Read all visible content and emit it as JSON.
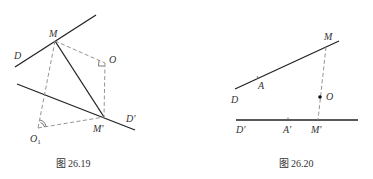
{
  "figures": [
    {
      "caption": "图 26.19",
      "labels": {
        "M": "M",
        "O": "O",
        "D": "D",
        "D_prime": "D'",
        "M_prime": "M'",
        "O1": "O",
        "O1_sub": "1"
      }
    },
    {
      "caption": "图 26.20",
      "labels": {
        "M": "M",
        "A": "A",
        "D": "D",
        "O": "O",
        "D_prime": "D'",
        "A_prime": "A'",
        "M_prime": "M'"
      }
    }
  ],
  "colors": {
    "line": "#222222",
    "dashed": "#888888",
    "text": "#333333"
  }
}
